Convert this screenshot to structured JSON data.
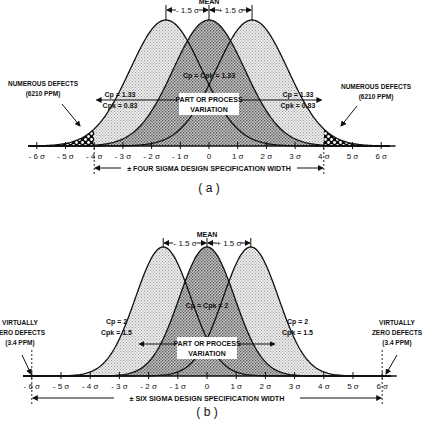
{
  "chart_data": [
    {
      "type": "diagram",
      "panel": "a",
      "caption": "( a )",
      "title": "Four sigma design with ±1.5σ mean shift",
      "mean_label": "MEAN",
      "shift_left_label": "- 1.5 σ",
      "shift_right_label": "+ 1.5 σ",
      "center_label": "Cp = Cpk = 1.33",
      "left_shift_label": [
        "Cp = 1.33",
        "Cpk = 0.83"
      ],
      "right_shift_label": [
        "Cp = 1.33",
        "Cpk = 0.83"
      ],
      "variation_label": [
        "PART OR PROCESS",
        "VARIATION"
      ],
      "defects_left": [
        "NUMEROUS DEFECTS",
        "(6210 PPM)"
      ],
      "defects_right": [
        "NUMEROUS DEFECTS",
        "(6210 PPM)"
      ],
      "spec_width_label": "± FOUR SIGMA DESIGN SPECIFICATION WIDTH",
      "spec_limits_sigma": [
        -4,
        4
      ],
      "x_ticks": [
        "- 6 σ",
        "- 5 σ",
        "- 4 σ",
        "- 3 σ",
        "- 2 σ",
        "- 1 σ",
        "0",
        "1 σ",
        "2 σ",
        "3 σ",
        "4 σ",
        "5 σ",
        "6 σ"
      ],
      "curve_means_sigma": [
        -1.5,
        0,
        1.5
      ],
      "xlim": [
        -6,
        6
      ]
    },
    {
      "type": "diagram",
      "panel": "b",
      "caption": "( b )",
      "title": "Six sigma design with ±1.5σ mean shift",
      "mean_label": "MEAN",
      "shift_left_label": "- 1.5 σ",
      "shift_right_label": "+ 1.5 σ",
      "center_label": "Cp = Cpk = 2",
      "left_shift_label": [
        "Cp = 2",
        "Cpk = 1.5"
      ],
      "right_shift_label": [
        "Cp = 2",
        "Cpk = 1.5"
      ],
      "variation_label": [
        "PART OR PROCESS",
        "VARIATION"
      ],
      "defects_left": [
        "VIRTUALLY",
        "ZERO DEFECTS",
        "(3.4 PPM)"
      ],
      "defects_right": [
        "VIRTUALLY",
        "ZERO DEFECTS",
        "(3.4 PPM)"
      ],
      "spec_width_label": "± SIX SIGMA DESIGN SPECIFICATION WIDTH",
      "spec_limits_sigma": [
        -6,
        6
      ],
      "x_ticks": [
        "- 6 σ",
        "- 5 σ",
        "- 4 σ",
        "- 3 σ",
        "- 2 σ",
        "- 1 σ",
        "0",
        "1 σ",
        "2 σ",
        "3 σ",
        "4 σ",
        "5 σ",
        "6 σ"
      ],
      "curve_means_sigma": [
        -1.5,
        0,
        1.5
      ],
      "xlim": [
        -6,
        6
      ]
    }
  ],
  "colors": {
    "ink": "#111111",
    "shift_fill": "#d9d9d9",
    "center_fill": "#a8a8a8",
    "background": "#ffffff"
  }
}
